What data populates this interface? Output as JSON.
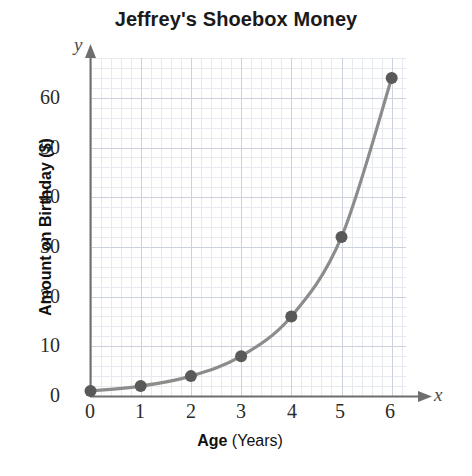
{
  "chart_data": {
    "type": "line",
    "title": "Jeffrey's Shoebox Money",
    "xlabel": "Age",
    "xlabel_unit": "(Years)",
    "ylabel": "Amount on Birthday ($)",
    "x_axis_letter": "x",
    "y_axis_letter": "y",
    "x": [
      0,
      1,
      2,
      3,
      4,
      5,
      6
    ],
    "values": [
      1,
      2,
      4,
      8,
      16,
      32,
      64
    ],
    "xticks": [
      "0",
      "1",
      "2",
      "3",
      "4",
      "5",
      "6"
    ],
    "yticks": [
      "0",
      "10",
      "20",
      "30",
      "40",
      "50",
      "60"
    ],
    "xlim": [
      0,
      6.3
    ],
    "ylim": [
      0,
      67
    ],
    "grid": true,
    "grid_minor": true,
    "legend": "none",
    "marker": "filled-circle",
    "series_color": "#8c8c8c",
    "marker_color": "#595959",
    "grid_color": "#d9dde6",
    "axis_color": "#6e6e6e"
  },
  "colors": {
    "title_text": "#1a1a1a",
    "tick_text": "#2b2b2b",
    "axis_title_text": "#111111",
    "background": "#ffffff"
  }
}
